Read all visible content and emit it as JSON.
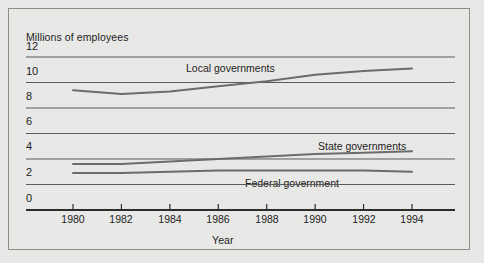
{
  "chart_data": {
    "type": "line",
    "title": "",
    "xlabel": "Year",
    "ylabel": "Millions of employees",
    "x": [
      1980,
      1982,
      1984,
      1986,
      1988,
      1990,
      1992,
      1994
    ],
    "xtick_labels": [
      "1980",
      "1982",
      "1984",
      "1986",
      "1988",
      "1990",
      "1992",
      "1994"
    ],
    "ytick_labels": [
      "0",
      "2",
      "4",
      "6",
      "8",
      "10",
      "12"
    ],
    "yticks": [
      0,
      2,
      4,
      6,
      8,
      10,
      12
    ],
    "ylim": [
      0,
      12
    ],
    "xlim": [
      1980,
      1994
    ],
    "grid": true,
    "legend": "inline-labels",
    "series": [
      {
        "name": "Local governments",
        "label": "Local governments",
        "values": [
          9.4,
          9.1,
          9.3,
          9.7,
          10.1,
          10.6,
          10.9,
          11.1
        ],
        "color": "#6b6b6b"
      },
      {
        "name": "State governments",
        "label": "State governments",
        "values": [
          3.6,
          3.6,
          3.8,
          4.0,
          4.2,
          4.4,
          4.5,
          4.6
        ],
        "color": "#6b6b6b"
      },
      {
        "name": "Federal government",
        "label": "Federal government",
        "values": [
          2.9,
          2.9,
          3.0,
          3.1,
          3.1,
          3.1,
          3.1,
          3.0
        ],
        "color": "#6b6b6b"
      }
    ],
    "annotations": [
      {
        "text": "Local governments",
        "x": 186,
        "y": 62
      },
      {
        "text": "State governments",
        "x": 318,
        "y": 140
      },
      {
        "text": "Federal government",
        "x": 245,
        "y": 177
      }
    ]
  },
  "colors": {
    "background": "#e9e9e7",
    "frame": "#8d8d8a",
    "axis": "#2b2b2b",
    "gridline": "#5a5a5a",
    "series": "#6b6b6b",
    "text": "#1c1c1c"
  }
}
